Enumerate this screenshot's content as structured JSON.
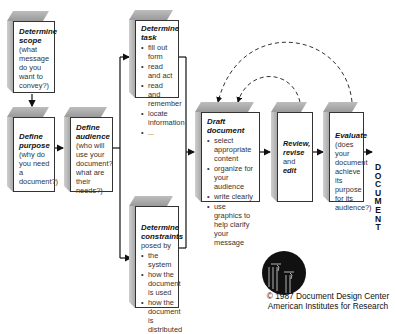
{
  "diagram": {
    "boxes": {
      "scope": {
        "title": "Determine scope",
        "body": "(what message do you want to convey?)"
      },
      "purpose": {
        "title": "Define purpose",
        "body": "(why do you need a document?)"
      },
      "audience": {
        "title": "Define audience",
        "body": "(who will use your document? what are their needs?)"
      },
      "task": {
        "title": "Determine task",
        "items": [
          "fill out form",
          "read and act",
          "read and remember",
          "locate information",
          "..."
        ]
      },
      "constraints": {
        "title": "Determine constraints",
        "subtitle": "posed by",
        "items": [
          "the system",
          "how the document is used",
          "how the document is distributed"
        ]
      },
      "draft": {
        "title": "Draft document",
        "items": [
          "select appropriate content",
          "organize for your audience",
          "write clearly",
          "use graphics to help clarify your message"
        ]
      },
      "review": {
        "title1": "Review,",
        "title2": "revise",
        "plain": "and",
        "title3": "edit"
      },
      "evaluate": {
        "title": "Evaluate",
        "body": "(does your document achieve its purpose for its audience?)"
      }
    },
    "output_label": "DOCUMENT",
    "output_letters": [
      "D",
      "O",
      "C",
      "U",
      "M",
      "E",
      "N",
      "T"
    ],
    "credit_line1": "© 1987 Document Design Center",
    "credit_line2": "American Institutes for Research",
    "colors": {
      "line": "#111111",
      "box_top": "#a8a8a8",
      "box_side": "#bdbdbd",
      "logo": "#111111"
    }
  }
}
